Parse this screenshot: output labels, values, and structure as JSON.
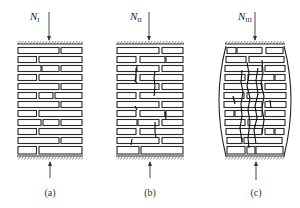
{
  "figure": {
    "panels": [
      {
        "id": "a",
        "caption": "(a)",
        "load_symbol": "N",
        "load_subscript": "I",
        "stage": "initial loading, no cracks",
        "x": 17,
        "width": 66
      },
      {
        "id": "b",
        "caption": "(b)",
        "load_symbol": "N",
        "load_subscript": "II",
        "stage": "vertical cracks through individual bricks",
        "x": 116,
        "width": 68
      },
      {
        "id": "c",
        "caption": "(c)",
        "load_symbol": "N",
        "load_subscript": "III",
        "stage": "continuous vertical cracks, lateral bulging",
        "x": 225,
        "width": 60
      }
    ],
    "geometry": {
      "top_plate_y": 44,
      "bottom_plate_y": 157,
      "rows": 12,
      "row_top": 47,
      "row_height": 9
    },
    "colors": {
      "line": "#2a2a2a",
      "background": "#ffffff"
    }
  }
}
